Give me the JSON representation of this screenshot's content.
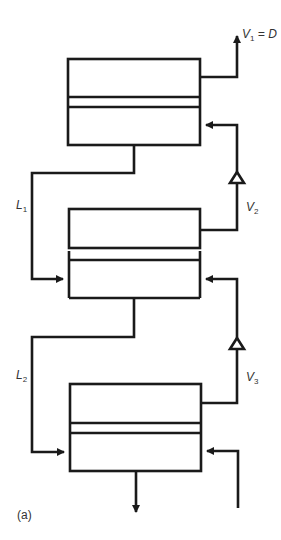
{
  "figure": {
    "panel_label": "(a)",
    "stroke_color": "#1a1a1a",
    "stages": [
      {
        "id": "stage-1",
        "position": "top"
      },
      {
        "id": "stage-2",
        "position": "middle"
      },
      {
        "id": "stage-3",
        "position": "bottom"
      }
    ],
    "labels": {
      "v1": {
        "main": "V",
        "sub": "1",
        "rest": " = D"
      },
      "v2": {
        "main": "V",
        "sub": "2"
      },
      "v3": {
        "main": "V",
        "sub": "3"
      },
      "l1": {
        "main": "L",
        "sub": "1"
      },
      "l2": {
        "main": "L",
        "sub": "2"
      }
    }
  }
}
